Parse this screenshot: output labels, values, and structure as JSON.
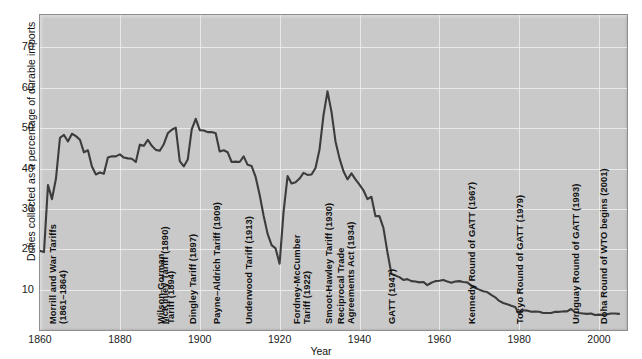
{
  "chart_data": {
    "type": "line",
    "title": "",
    "xlabel": "Year",
    "ylabel": "Duties collected as a percentage of durable imports",
    "xlim": [
      1860,
      2007
    ],
    "ylim": [
      0,
      78
    ],
    "grid": true,
    "legend": "none",
    "line_color": "#3c3c3c",
    "plot_bg": "#c9c9c9",
    "gridline_color": "#eeeeee",
    "y_ticks": [
      10,
      20,
      30,
      40,
      50,
      60,
      70
    ],
    "x_ticks": [
      1860,
      1880,
      1900,
      1920,
      1940,
      1960,
      1980,
      2000
    ],
    "x": [
      1860,
      1861,
      1862,
      1863,
      1864,
      1865,
      1866,
      1867,
      1868,
      1869,
      1870,
      1871,
      1872,
      1873,
      1874,
      1875,
      1876,
      1877,
      1878,
      1879,
      1880,
      1881,
      1882,
      1883,
      1884,
      1885,
      1886,
      1887,
      1888,
      1889,
      1890,
      1891,
      1892,
      1893,
      1894,
      1895,
      1896,
      1897,
      1898,
      1899,
      1900,
      1901,
      1902,
      1903,
      1904,
      1905,
      1906,
      1907,
      1908,
      1909,
      1910,
      1911,
      1912,
      1913,
      1914,
      1915,
      1916,
      1917,
      1918,
      1919,
      1920,
      1921,
      1922,
      1923,
      1924,
      1925,
      1926,
      1927,
      1928,
      1929,
      1930,
      1931,
      1932,
      1933,
      1934,
      1935,
      1936,
      1937,
      1938,
      1939,
      1940,
      1941,
      1942,
      1943,
      1944,
      1945,
      1946,
      1947,
      1948,
      1949,
      1950,
      1951,
      1952,
      1953,
      1954,
      1955,
      1956,
      1957,
      1958,
      1959,
      1960,
      1961,
      1962,
      1963,
      1964,
      1965,
      1966,
      1967,
      1968,
      1969,
      1970,
      1971,
      1972,
      1973,
      1974,
      1975,
      1976,
      1977,
      1978,
      1979,
      1980,
      1981,
      1982,
      1983,
      1984,
      1985,
      1986,
      1987,
      1988,
      1989,
      1990,
      1991,
      1992,
      1993,
      1994,
      1995,
      1996,
      1997,
      1998,
      1999,
      2000,
      2001,
      2002,
      2003,
      2004,
      2005
    ],
    "y": [
      19.6,
      19.3,
      35.9,
      32.4,
      37.5,
      47.6,
      48.3,
      46.7,
      48.6,
      48.0,
      47.1,
      44.0,
      44.5,
      40.5,
      38.5,
      39.0,
      38.7,
      42.7,
      43.0,
      43.0,
      43.5,
      42.7,
      42.5,
      42.4,
      41.6,
      45.9,
      45.6,
      47.1,
      45.6,
      44.6,
      44.4,
      46.0,
      48.7,
      49.6,
      50.1,
      41.8,
      40.5,
      42.2,
      49.7,
      52.3,
      49.5,
      49.4,
      49.0,
      49.0,
      48.7,
      44.2,
      44.5,
      44.0,
      41.6,
      41.7,
      41.6,
      43.0,
      40.9,
      40.6,
      37.9,
      33.5,
      28.3,
      23.8,
      21.0,
      20.2,
      16.4,
      29.3,
      38.1,
      36.3,
      36.6,
      37.5,
      38.9,
      38.4,
      38.5,
      40.1,
      44.7,
      53.2,
      59.1,
      54.0,
      46.7,
      42.5,
      39.3,
      37.3,
      38.8,
      37.3,
      36.0,
      34.6,
      32.4,
      33.0,
      28.2,
      28.2,
      25.3,
      19.3,
      13.9,
      13.5,
      13.1,
      12.4,
      12.6,
      12.1,
      12.0,
      11.8,
      11.9,
      11.1,
      11.7,
      12.1,
      12.2,
      12.4,
      12.0,
      11.7,
      12.0,
      12.1,
      11.9,
      11.8,
      11.0,
      10.4,
      10.0,
      9.6,
      9.4,
      8.7,
      8.1,
      7.2,
      6.7,
      6.4,
      6.0,
      5.7,
      4.0,
      4.9,
      4.8,
      4.5,
      4.6,
      4.5,
      4.2,
      4.2,
      4.2,
      4.5,
      4.5,
      4.6,
      4.6,
      5.2,
      4.4,
      4.2,
      4.1,
      4.0,
      4.1,
      3.7,
      3.8,
      3.7,
      3.9,
      4.1,
      4.1,
      4.0
    ],
    "annotations": [
      {
        "id": "morrill",
        "text": "Morrill and War Tariffs\n(1861–1864)",
        "year": 1862,
        "lines": 2
      },
      {
        "id": "mckinley",
        "text": "McKinley Tariff (1890)",
        "year": 1890,
        "lines": 1
      },
      {
        "id": "dingley",
        "text": "Dingley Tariff (1897)",
        "year": 1897,
        "lines": 1
      },
      {
        "id": "payne-aldrich",
        "text": "Payne–Aldrich Tariff (1909)",
        "year": 1903,
        "lines": 1
      },
      {
        "id": "wilson-gorman",
        "text": "Wilson-Gorman\nTariff (1894)",
        "year": 1889,
        "lines": 2
      },
      {
        "id": "underwood",
        "text": "Underwood Tariff (1913)",
        "year": 1911,
        "lines": 1
      },
      {
        "id": "fordney",
        "text": "Fordney-McCumber\nTariff (1922)",
        "year": 1923,
        "lines": 2
      },
      {
        "id": "smoot-hawley",
        "text": "Smoot-Hawley Tariff (1930)",
        "year": 1931,
        "lines": 1
      },
      {
        "id": "rtaa",
        "text": "Reciprocal Trade\nAgreements Act (1934)",
        "year": 1934,
        "lines": 2
      },
      {
        "id": "gatt",
        "text": "GATT (1947)",
        "year": 1947,
        "lines": 1
      },
      {
        "id": "kennedy-round",
        "text": "Kennedy Round of GATT (1967)",
        "year": 1967,
        "lines": 1
      },
      {
        "id": "tokyo-round",
        "text": "Tokyo Round of GATT (1979)",
        "year": 1979,
        "lines": 1
      },
      {
        "id": "uruguay-round",
        "text": "Uruguay Round of GATT (1993)",
        "year": 1993,
        "lines": 1
      },
      {
        "id": "doha-round",
        "text": "Doha Round of WTO begins (2001)",
        "year": 2000,
        "lines": 1
      }
    ]
  },
  "axis": {
    "y_tick_labels": [
      "70",
      "60",
      "50",
      "40",
      "30",
      "20",
      "10"
    ],
    "x_tick_labels": [
      "1860",
      "1880",
      "1900",
      "1920",
      "1940",
      "1960",
      "1980",
      "2000"
    ],
    "x_axis_title": "Year",
    "y_axis_title": "Duties collected as a percentage of durable imports"
  }
}
